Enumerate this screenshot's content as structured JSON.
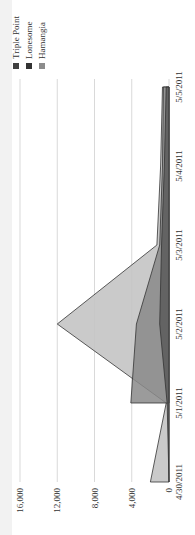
{
  "chart_data": {
    "type": "area",
    "orientation": "rotated 90 degrees counter-clockwise",
    "stacked": false,
    "title": "",
    "xlabel": "",
    "ylabel": "",
    "categories": [
      "4/30/2011",
      "5/1/2011",
      "5/2/2011",
      "5/3/2011",
      "5/4/2011",
      "5/5/2011"
    ],
    "series": [
      {
        "name": "Triple Point",
        "color": "#4a4a4a",
        "values": [
          0,
          200,
          1000,
          800,
          500,
          300
        ]
      },
      {
        "name": "Lonesome",
        "color": "#7f7f7f",
        "values": [
          null,
          4100,
          3500,
          1000,
          700,
          600
        ]
      },
      {
        "name": "Hamangia",
        "color": "#b3b3b3",
        "values": [
          2000,
          300,
          12000,
          1300,
          900,
          700
        ]
      }
    ],
    "ylim": [
      0,
      16000
    ],
    "yticks": [
      "0",
      "4,000",
      "8,000",
      "12,000",
      "16,000"
    ],
    "grid": true,
    "legend_position": "right"
  },
  "legend": {
    "items": [
      {
        "label": "Triple Point",
        "color": "#404040"
      },
      {
        "label": "Lonesome",
        "color": "#333333"
      },
      {
        "label": "Hamangia",
        "color": "#8c8c8c"
      }
    ]
  }
}
